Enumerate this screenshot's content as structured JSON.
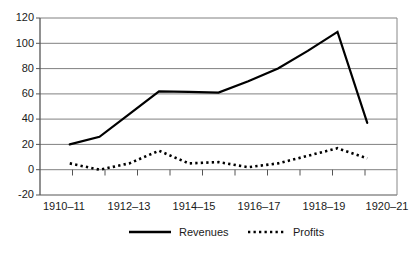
{
  "chart_data": {
    "type": "line",
    "title": "",
    "subtitle": "",
    "xlabel": "",
    "ylabel": "",
    "grid": true,
    "legend_position": "bottom",
    "ylim": [
      -20,
      120
    ],
    "yticks": [
      120,
      100,
      80,
      60,
      40,
      20,
      0,
      -20
    ],
    "ytick_labels": [
      "120",
      "100",
      "80",
      "60",
      "40",
      "20",
      "0",
      "-20"
    ],
    "xtick_labels": [
      "1910–11",
      "1912–13",
      "1914–15",
      "1916–17",
      "1918–19",
      "1920–21"
    ],
    "x": [
      "1910–11",
      "1911–12",
      "1912–13",
      "1913–14",
      "1914–15",
      "1915–16",
      "1916–17",
      "1917–18",
      "1918–19",
      "1919–20",
      "1920–21"
    ],
    "series": [
      {
        "name": "Revenues",
        "style": "solid",
        "color": "#000000",
        "values": [
          20,
          26,
          44,
          62,
          61.5,
          61,
          70,
          80,
          94,
          109,
          37
        ]
      },
      {
        "name": "Profits",
        "style": "dotted",
        "color": "#000000",
        "values": [
          5,
          0,
          5,
          15,
          5,
          6,
          2,
          5,
          11,
          17,
          9
        ]
      }
    ]
  },
  "legend": {
    "items": [
      {
        "label": "Revenues",
        "style": "solid"
      },
      {
        "label": "Profits",
        "style": "dotted"
      }
    ]
  },
  "axis": {
    "y_labels": [
      "120",
      "100",
      "80",
      "60",
      "40",
      "20",
      "0",
      "-20"
    ],
    "x_labels": [
      "1910–11",
      "1912–13",
      "1914–15",
      "1916–17",
      "1918–19",
      "1920–21"
    ]
  }
}
